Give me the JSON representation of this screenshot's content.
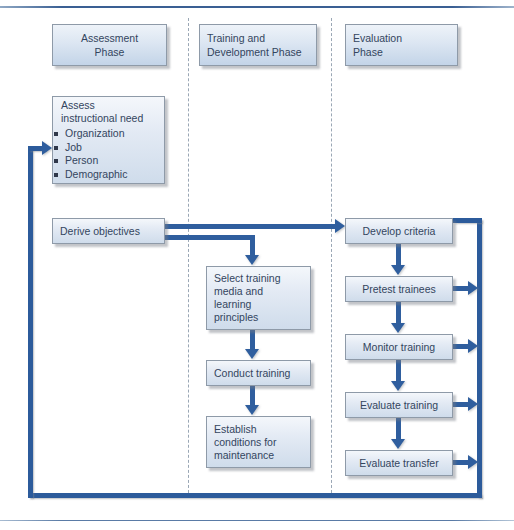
{
  "diagram": {
    "colors": {
      "arrow": "#2f5e9e",
      "loop": "#2c5b9b",
      "box_border": "#8e9aa8",
      "box_fill_top": "#f4f7fb",
      "box_fill_bottom": "#cfdceb",
      "text": "#33455e",
      "divider": "#9aa7b5",
      "rule": "#3a5f93"
    },
    "phases": [
      {
        "id": "assessment",
        "label": "Assessment\nPhase"
      },
      {
        "id": "training",
        "label": "Training and\nDevelopment Phase"
      },
      {
        "id": "evaluation",
        "label": "Evaluation\nPhase"
      }
    ],
    "assessment_column": {
      "assess_box": {
        "heading": "Assess\ninstructional need",
        "bullets": [
          "Organization",
          "Job",
          "Person",
          "Demographic"
        ]
      },
      "derive_box": {
        "label": "Derive objectives"
      }
    },
    "training_column": {
      "steps": [
        {
          "id": "select-media",
          "label": "Select training\nmedia and\nlearning\nprinciples"
        },
        {
          "id": "conduct-training",
          "label": "Conduct training"
        },
        {
          "id": "establish-conditions",
          "label": "Establish\nconditions for\nmaintenance"
        }
      ]
    },
    "evaluation_column": {
      "steps": [
        {
          "id": "develop-criteria",
          "label": "Develop criteria"
        },
        {
          "id": "pretest-trainees",
          "label": "Pretest trainees"
        },
        {
          "id": "monitor-training",
          "label": "Monitor training"
        },
        {
          "id": "evaluate-training",
          "label": "Evaluate training"
        },
        {
          "id": "evaluate-transfer",
          "label": "Evaluate transfer"
        }
      ]
    }
  }
}
